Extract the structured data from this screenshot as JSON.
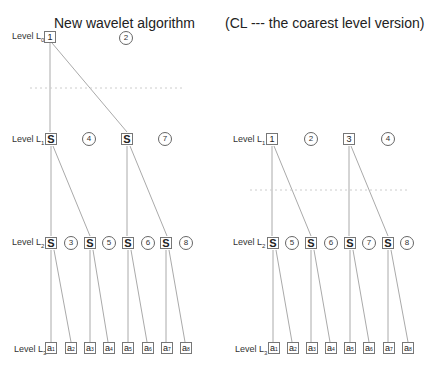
{
  "left_panel": {
    "title": "New wavelet algorithm",
    "levels": {
      "L0": {
        "label": "Level L",
        "sub": "0"
      },
      "L1": {
        "label": "Level L",
        "sub": "1"
      },
      "L2": {
        "label": "Level L",
        "sub": "2"
      },
      "L3": {
        "label": "Level L",
        "sub": "3"
      }
    },
    "L0_box": "1",
    "L0_circle": "2",
    "L1_boxes": [
      "S",
      "S"
    ],
    "L1_circles": [
      "4",
      "7"
    ],
    "L2_boxes": [
      "S",
      "S",
      "S",
      "S"
    ],
    "L2_circles": [
      "3",
      "5",
      "6",
      "8"
    ],
    "L3_boxes": [
      {
        "main": "a",
        "sub": "1"
      },
      {
        "main": "a",
        "sub": "2"
      },
      {
        "main": "a",
        "sub": "3"
      },
      {
        "main": "a",
        "sub": "4"
      },
      {
        "main": "a",
        "sub": "5"
      },
      {
        "main": "a",
        "sub": "6"
      },
      {
        "main": "a",
        "sub": "7"
      },
      {
        "main": "a",
        "sub": "8"
      }
    ]
  },
  "right_panel": {
    "title": "(CL --- the coarest level version)",
    "levels": {
      "L1": {
        "label": "Level L",
        "sub": "1"
      },
      "L2": {
        "label": "Level L",
        "sub": "2"
      },
      "L3": {
        "label": "Level L",
        "sub": "3"
      }
    },
    "L1_boxes": [
      "1",
      "3"
    ],
    "L1_circles": [
      "2",
      "4"
    ],
    "L2_boxes": [
      "S",
      "S",
      "S",
      "S"
    ],
    "L2_circles": [
      "5",
      "6",
      "7",
      "8"
    ],
    "L3_boxes": [
      {
        "main": "a",
        "sub": "1"
      },
      {
        "main": "a",
        "sub": "2"
      },
      {
        "main": "a",
        "sub": "3"
      },
      {
        "main": "a",
        "sub": "4"
      },
      {
        "main": "a",
        "sub": "5"
      },
      {
        "main": "a",
        "sub": "6"
      },
      {
        "main": "a",
        "sub": "7"
      },
      {
        "main": "a",
        "sub": "8"
      }
    ]
  },
  "colors": {
    "line": "#aaaaaa",
    "dotted": "#cccccc",
    "border": "#777777"
  }
}
